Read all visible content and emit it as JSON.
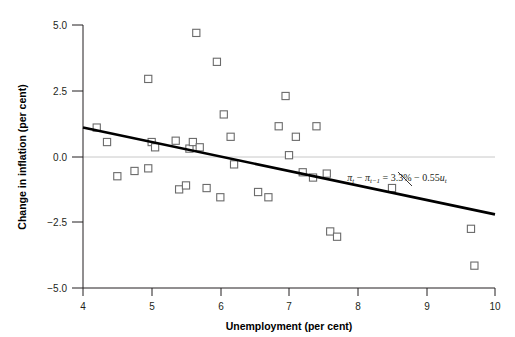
{
  "chart_data": {
    "type": "scatter",
    "title": "",
    "xlabel": "Unemployment (per cent)",
    "ylabel": "Change in inflation (per cent)",
    "xlim": [
      4,
      10
    ],
    "ylim": [
      -5.0,
      5.0
    ],
    "xticks": [
      4,
      5,
      6,
      7,
      8,
      9,
      10
    ],
    "xtick_labels": [
      "4",
      "5",
      "6",
      "7",
      "8",
      "9",
      "10"
    ],
    "yticks": [
      -5.0,
      -2.5,
      0.0,
      2.5,
      5.0
    ],
    "ytick_labels": [
      "−5.0",
      "−2.5",
      "0.0",
      "2.5",
      "5.0"
    ],
    "grid": false,
    "zero_reference_line": 0.0,
    "legend": "none",
    "marker": "open-square",
    "points": [
      {
        "x": 4.2,
        "y": 1.1
      },
      {
        "x": 4.35,
        "y": 0.55
      },
      {
        "x": 4.5,
        "y": -0.75
      },
      {
        "x": 4.75,
        "y": -0.55
      },
      {
        "x": 4.95,
        "y": 2.95
      },
      {
        "x": 4.95,
        "y": -0.45
      },
      {
        "x": 5.0,
        "y": 0.55
      },
      {
        "x": 5.05,
        "y": 0.35
      },
      {
        "x": 5.35,
        "y": 0.6
      },
      {
        "x": 5.4,
        "y": -1.25
      },
      {
        "x": 5.5,
        "y": -1.1
      },
      {
        "x": 5.55,
        "y": 0.3
      },
      {
        "x": 5.6,
        "y": 0.55
      },
      {
        "x": 5.65,
        "y": 4.7
      },
      {
        "x": 5.7,
        "y": 0.35
      },
      {
        "x": 5.8,
        "y": -1.2
      },
      {
        "x": 5.95,
        "y": 3.6
      },
      {
        "x": 6.0,
        "y": -1.55
      },
      {
        "x": 6.05,
        "y": 1.6
      },
      {
        "x": 6.15,
        "y": 0.75
      },
      {
        "x": 6.2,
        "y": -0.3
      },
      {
        "x": 6.55,
        "y": -1.35
      },
      {
        "x": 6.7,
        "y": -1.55
      },
      {
        "x": 6.85,
        "y": 1.15
      },
      {
        "x": 6.95,
        "y": 2.3
      },
      {
        "x": 7.0,
        "y": 0.05
      },
      {
        "x": 7.1,
        "y": 0.75
      },
      {
        "x": 7.2,
        "y": -0.6
      },
      {
        "x": 7.35,
        "y": -0.8
      },
      {
        "x": 7.4,
        "y": 1.15
      },
      {
        "x": 7.55,
        "y": -0.65
      },
      {
        "x": 7.6,
        "y": -2.85
      },
      {
        "x": 7.7,
        "y": -3.05
      },
      {
        "x": 8.5,
        "y": -1.2
      },
      {
        "x": 9.65,
        "y": -2.75
      },
      {
        "x": 9.7,
        "y": -4.15
      }
    ],
    "fit_line": {
      "label": "πt − πt−1 = 3.3% − 0.55ut",
      "intercept": 3.3,
      "slope": -0.55,
      "x_start": 4.0,
      "x_end": 10.0,
      "y_start": 1.1,
      "y_end": -2.2
    },
    "annotation": {
      "pi_symbol": "π",
      "sub_t": "t",
      "sub_t_minus_1": "t−1",
      "minus": "−",
      "equals": "=",
      "intercept_text": "3.3%",
      "slope_text": "0.55",
      "u_symbol": "u"
    }
  },
  "colors": {
    "axis": "#231f20",
    "marker_stroke": "#6b6b6b",
    "marker_fill": "#ffffff",
    "fit_line": "#000000",
    "zero_line": "#c8c8c8",
    "background": "#ffffff"
  }
}
